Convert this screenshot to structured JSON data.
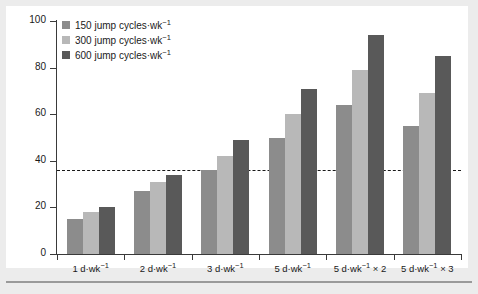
{
  "figure": {
    "background_color": "#ececec",
    "panel_color": "#ffffff",
    "rule_color": "#9a9a9a"
  },
  "legend": {
    "items": [
      {
        "label": "150 jump cycles·wk",
        "exponent": "−1",
        "color": "#8c8c8c",
        "swatch_name": "legend-swatch-150"
      },
      {
        "label": "300 jump cycles·wk",
        "exponent": "−1",
        "color": "#b8b8b8",
        "swatch_name": "legend-swatch-300"
      },
      {
        "label": "600 jump cycles·wk",
        "exponent": "−1",
        "color": "#595959",
        "swatch_name": "legend-swatch-600"
      }
    ]
  },
  "chart_data": {
    "type": "bar",
    "title": "",
    "xlabel": "",
    "ylabel": "Osteogeneic index",
    "ylim": [
      0,
      100
    ],
    "yticks": [
      0,
      20,
      40,
      60,
      80,
      100
    ],
    "grid": false,
    "legend_position": "top-left",
    "categories": [
      "1 d·wk⁻¹",
      "2 d·wk⁻¹",
      "3 d·wk⁻¹",
      "5 d·wk⁻¹",
      "5 d·wk⁻¹ × 2",
      "5 d·wk⁻¹ × 3"
    ],
    "category_parts": [
      {
        "base": "1 d·wk",
        "exponent": "−1",
        "suffix": ""
      },
      {
        "base": "2 d·wk",
        "exponent": "−1",
        "suffix": ""
      },
      {
        "base": "3 d·wk",
        "exponent": "−1",
        "suffix": ""
      },
      {
        "base": "5 d·wk",
        "exponent": "−1",
        "suffix": ""
      },
      {
        "base": "5 d·wk",
        "exponent": "−1",
        "suffix": " × 2"
      },
      {
        "base": "5 d·wk",
        "exponent": "−1",
        "suffix": " × 3"
      }
    ],
    "series": [
      {
        "name": "150 jump cycles·wk⁻¹",
        "color": "#8c8c8c",
        "values": [
          15,
          27,
          36,
          50,
          64,
          55
        ]
      },
      {
        "name": "300 jump cycles·wk⁻¹",
        "color": "#b8b8b8",
        "values": [
          18,
          31,
          42,
          60,
          79,
          69
        ]
      },
      {
        "name": "600 jump cycles·wk⁻¹",
        "color": "#595959",
        "values": [
          20,
          34,
          49,
          71,
          94,
          85
        ]
      }
    ],
    "reference_line": {
      "value": 36,
      "style": "dashed",
      "color": "#1a1a1a"
    }
  }
}
